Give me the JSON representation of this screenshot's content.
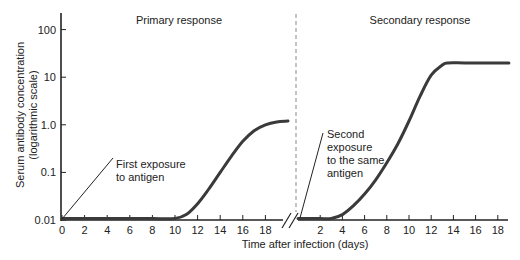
{
  "chart_data": {
    "type": "line",
    "title": "",
    "panels": [
      {
        "name": "primary",
        "title": "Primary response",
        "xlim": [
          0,
          20
        ],
        "xticks": [
          0,
          2,
          4,
          6,
          8,
          10,
          12,
          14,
          16,
          18
        ],
        "x": [
          0,
          2,
          4,
          6,
          8,
          10,
          11,
          12,
          13,
          14,
          15,
          16,
          17,
          18,
          19,
          20
        ],
        "y": [
          0.01,
          0.01,
          0.01,
          0.01,
          0.01,
          0.0105,
          0.013,
          0.022,
          0.045,
          0.1,
          0.22,
          0.45,
          0.75,
          1.0,
          1.15,
          1.2
        ],
        "annotation": [
          "First exposure",
          "to antigen"
        ],
        "annotation_x": 0
      },
      {
        "name": "secondary",
        "title": "Secondary response",
        "xlim": [
          0,
          19
        ],
        "xticks": [
          2,
          4,
          6,
          8,
          10,
          12,
          14,
          16,
          18
        ],
        "x": [
          0,
          1,
          2,
          3,
          4,
          5,
          6,
          7,
          8,
          9,
          10,
          11,
          12,
          13,
          13.5,
          15,
          17,
          19
        ],
        "y": [
          0.01,
          0.01,
          0.01,
          0.0105,
          0.013,
          0.02,
          0.035,
          0.07,
          0.16,
          0.4,
          1.2,
          4,
          11,
          18,
          20,
          20,
          20,
          20
        ],
        "annotation": [
          "Second",
          "exposure",
          "to the same",
          "antigen"
        ],
        "annotation_x": 0
      }
    ],
    "ylabel": [
      "Serum antibody concentration",
      "(logarithmic scale)"
    ],
    "xlabel": "Time after infection (days)",
    "yscale": "log",
    "ylim": [
      0.01,
      200
    ],
    "yticks": [
      0.01,
      0.1,
      1.0,
      10,
      100
    ],
    "ytick_labels": [
      "0.01",
      "0.1",
      "1.0",
      "10",
      "100"
    ],
    "grid": false,
    "axis_break": true,
    "line_color": "#3a3a3a"
  }
}
